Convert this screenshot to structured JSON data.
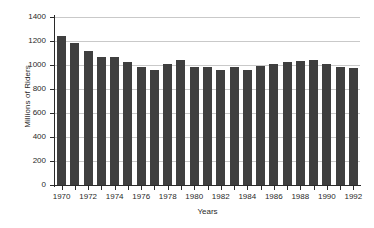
{
  "chart_data": {
    "type": "bar",
    "title": "",
    "xlabel": "Years",
    "ylabel": "Millions of Riders",
    "categories": [
      1970,
      1971,
      1972,
      1973,
      1974,
      1975,
      1976,
      1977,
      1978,
      1979,
      1980,
      1981,
      1982,
      1983,
      1984,
      1985,
      1986,
      1987,
      1988,
      1989,
      1990,
      1991,
      1992
    ],
    "values": [
      1240,
      1180,
      1115,
      1070,
      1070,
      1025,
      985,
      960,
      1010,
      1040,
      980,
      980,
      955,
      980,
      955,
      990,
      1010,
      1025,
      1035,
      1040,
      1005,
      980,
      975
    ],
    "series": [
      {
        "name": "Riders",
        "values": [
          1240,
          1180,
          1115,
          1070,
          1070,
          1025,
          985,
          960,
          1010,
          1040,
          980,
          980,
          955,
          980,
          955,
          990,
          1010,
          1025,
          1035,
          1040,
          1005,
          980,
          975
        ]
      }
    ],
    "ylim": [
      0,
      1400
    ],
    "ytick_values": [
      0,
      200,
      400,
      600,
      800,
      1000,
      1200,
      1400
    ],
    "ytick_labels": [
      "0",
      "200",
      "400",
      "600",
      "800",
      "1000",
      "1200",
      "1400"
    ],
    "xtick_values": [
      1970,
      1972,
      1974,
      1976,
      1978,
      1980,
      1982,
      1984,
      1986,
      1988,
      1990,
      1992
    ],
    "xtick_labels": [
      "1970",
      "1972",
      "1974",
      "1976",
      "1978",
      "1980",
      "1982",
      "1984",
      "1986",
      "1988",
      "1990",
      "1992"
    ],
    "grid": true,
    "legend": false,
    "legend_position": "none",
    "bar_color": "#3f3f3f",
    "grid_color": "#c9c9c9",
    "axis_color": "#2a2a2a",
    "background_color": "#ffffff"
  }
}
